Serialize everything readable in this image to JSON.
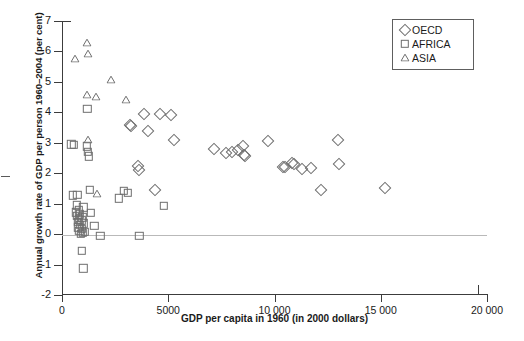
{
  "chart_data": {
    "type": "scatter",
    "title": "",
    "xlabel": "GDP per capita in 1960 (in 2000 dollars)",
    "ylabel": "Annual growth rate of GDP per person 1960–2004 (per cent)",
    "xlim": [
      0,
      20000
    ],
    "ylim": [
      -2,
      7
    ],
    "xticks": [
      0,
      5000,
      10000,
      15000,
      20000
    ],
    "xticklabels": [
      "0",
      "5000",
      "10 000",
      "15 000",
      "20 000"
    ],
    "yticks": [
      -2,
      -1,
      0,
      1,
      2,
      3,
      4,
      5,
      6,
      7
    ],
    "yticklabels": [
      "-2",
      "-1",
      "0",
      "1",
      "2",
      "3",
      "4",
      "5",
      "6",
      "7"
    ],
    "grid": false,
    "zero_reference_line": 0,
    "legend_position": "top-right",
    "series": [
      {
        "name": "OECD",
        "marker": "diamond",
        "color": "#6e6e6e",
        "points": [
          [
            3180,
            3.6
          ],
          [
            3230,
            3.55
          ],
          [
            3560,
            2.25
          ],
          [
            3620,
            2.1
          ],
          [
            3880,
            3.95
          ],
          [
            4050,
            3.4
          ],
          [
            4380,
            1.45
          ],
          [
            4600,
            3.95
          ],
          [
            5150,
            3.9
          ],
          [
            5250,
            3.1
          ],
          [
            7150,
            2.8
          ],
          [
            7700,
            2.65
          ],
          [
            8000,
            2.7
          ],
          [
            8300,
            2.75
          ],
          [
            8520,
            2.9
          ],
          [
            8560,
            2.6
          ],
          [
            8600,
            2.55
          ],
          [
            9700,
            3.05
          ],
          [
            10400,
            2.22
          ],
          [
            10500,
            2.2
          ],
          [
            10800,
            2.35
          ],
          [
            10900,
            2.3
          ],
          [
            11300,
            2.15
          ],
          [
            11700,
            2.18
          ],
          [
            12200,
            1.45
          ],
          [
            13000,
            3.1
          ],
          [
            13050,
            2.3
          ],
          [
            15200,
            1.5
          ]
        ]
      },
      {
        "name": "AFRICA",
        "marker": "square",
        "color": "#6e6e6e",
        "points": [
          [
            430,
            2.95
          ],
          [
            560,
            2.93
          ],
          [
            510,
            1.28
          ],
          [
            720,
            1.3
          ],
          [
            640,
            0.72
          ],
          [
            700,
            0.95
          ],
          [
            720,
            0.6
          ],
          [
            740,
            0.4
          ],
          [
            760,
            0.22
          ],
          [
            790,
            0.78
          ],
          [
            800,
            0.48
          ],
          [
            820,
            0.1
          ],
          [
            830,
            0.3
          ],
          [
            850,
            0.65
          ],
          [
            880,
            0.02
          ],
          [
            900,
            0.45
          ],
          [
            930,
            0.18
          ],
          [
            950,
            0.55
          ],
          [
            980,
            0.05
          ],
          [
            1010,
            0.88
          ],
          [
            1040,
            0.35
          ],
          [
            1080,
            0.08
          ],
          [
            930,
            -0.55
          ],
          [
            1010,
            -1.12
          ],
          [
            1190,
            4.12
          ],
          [
            1180,
            2.88
          ],
          [
            1210,
            2.7
          ],
          [
            1270,
            2.55
          ],
          [
            1320,
            1.45
          ],
          [
            1360,
            0.7
          ],
          [
            1520,
            0.28
          ],
          [
            1800,
            -0.05
          ],
          [
            2680,
            1.18
          ],
          [
            2900,
            1.42
          ],
          [
            3100,
            1.35
          ],
          [
            3640,
            -0.05
          ],
          [
            4800,
            0.92
          ]
        ]
      },
      {
        "name": "ASIA",
        "marker": "triangle",
        "color": "#6e6e6e",
        "points": [
          [
            600,
            5.75
          ],
          [
            1180,
            6.28
          ],
          [
            1200,
            5.9
          ],
          [
            1180,
            4.58
          ],
          [
            1600,
            4.52
          ],
          [
            2300,
            5.05
          ],
          [
            1210,
            3.1
          ],
          [
            3000,
            4.42
          ],
          [
            1640,
            1.32
          ]
        ]
      }
    ]
  },
  "legend": {
    "items": [
      {
        "label": "OECD",
        "marker": "diamond-icon"
      },
      {
        "label": "AFRICA",
        "marker": "square-icon"
      },
      {
        "label": "ASIA",
        "marker": "triangle-icon"
      }
    ]
  },
  "colors": {
    "marker": "#6e6e6e",
    "axis": "#3c3c3c",
    "zero_line": "#b9b9b9",
    "text": "#1a1a1a",
    "background": "#ffffff"
  }
}
